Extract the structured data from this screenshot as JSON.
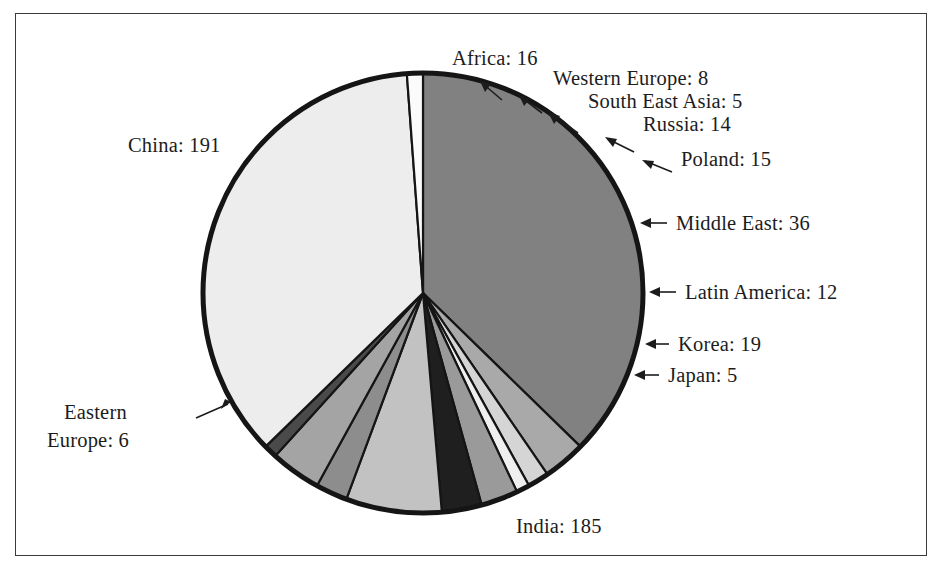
{
  "figure": {
    "kind": "pie-chart-figure",
    "background_color": "#ffffff",
    "frame_color": "#3a3a3a",
    "outline_color": "#151515"
  },
  "chart_data": {
    "type": "pie",
    "title": "",
    "xlabel": "",
    "ylabel": "",
    "total": 512,
    "start_angle_deg": -90,
    "direction": "clockwise",
    "labels": [
      "China",
      "Africa",
      "Western Europe",
      "South East Asia",
      "Russia",
      "Poland",
      "Middle East",
      "Latin America",
      "Korea",
      "Japan",
      "India",
      "Eastern Europe"
    ],
    "values": [
      191,
      16,
      8,
      5,
      14,
      15,
      36,
      12,
      19,
      5,
      185,
      6
    ],
    "colors": [
      "#818181",
      "#a9a9a9",
      "#d5d5d5",
      "#efefef",
      "#9a9a9a",
      "#1f1f1f",
      "#c2c2c2",
      "#8d8d8d",
      "#a4a4a4",
      "#4a4a4a",
      "#ededed",
      "#fbfbfb"
    ],
    "slice_labels": [
      "China: 191",
      "Africa: 16",
      "Western Europe: 8",
      "South East Asia: 5",
      "Russia: 14",
      "Poland: 15",
      "Middle East: 36",
      "Latin America: 12",
      "Korea: 19",
      "Japan: 5",
      "India: 185",
      "Eastern Europe: 6"
    ],
    "legend": "none",
    "grid": false
  },
  "labels": {
    "china": "China: 191",
    "africa": "Africa: 16",
    "western_europe": "Western Europe: 8",
    "south_east_asia": "South East Asia: 5",
    "russia": "Russia: 14",
    "poland": "Poland: 15",
    "middle_east": "Middle East: 36",
    "latin_america": "Latin America: 12",
    "korea": "Korea: 19",
    "japan": "Japan: 5",
    "india": "India: 185",
    "eastern_europe_line1": "Eastern",
    "eastern_europe_line2": "Europe: 6"
  }
}
